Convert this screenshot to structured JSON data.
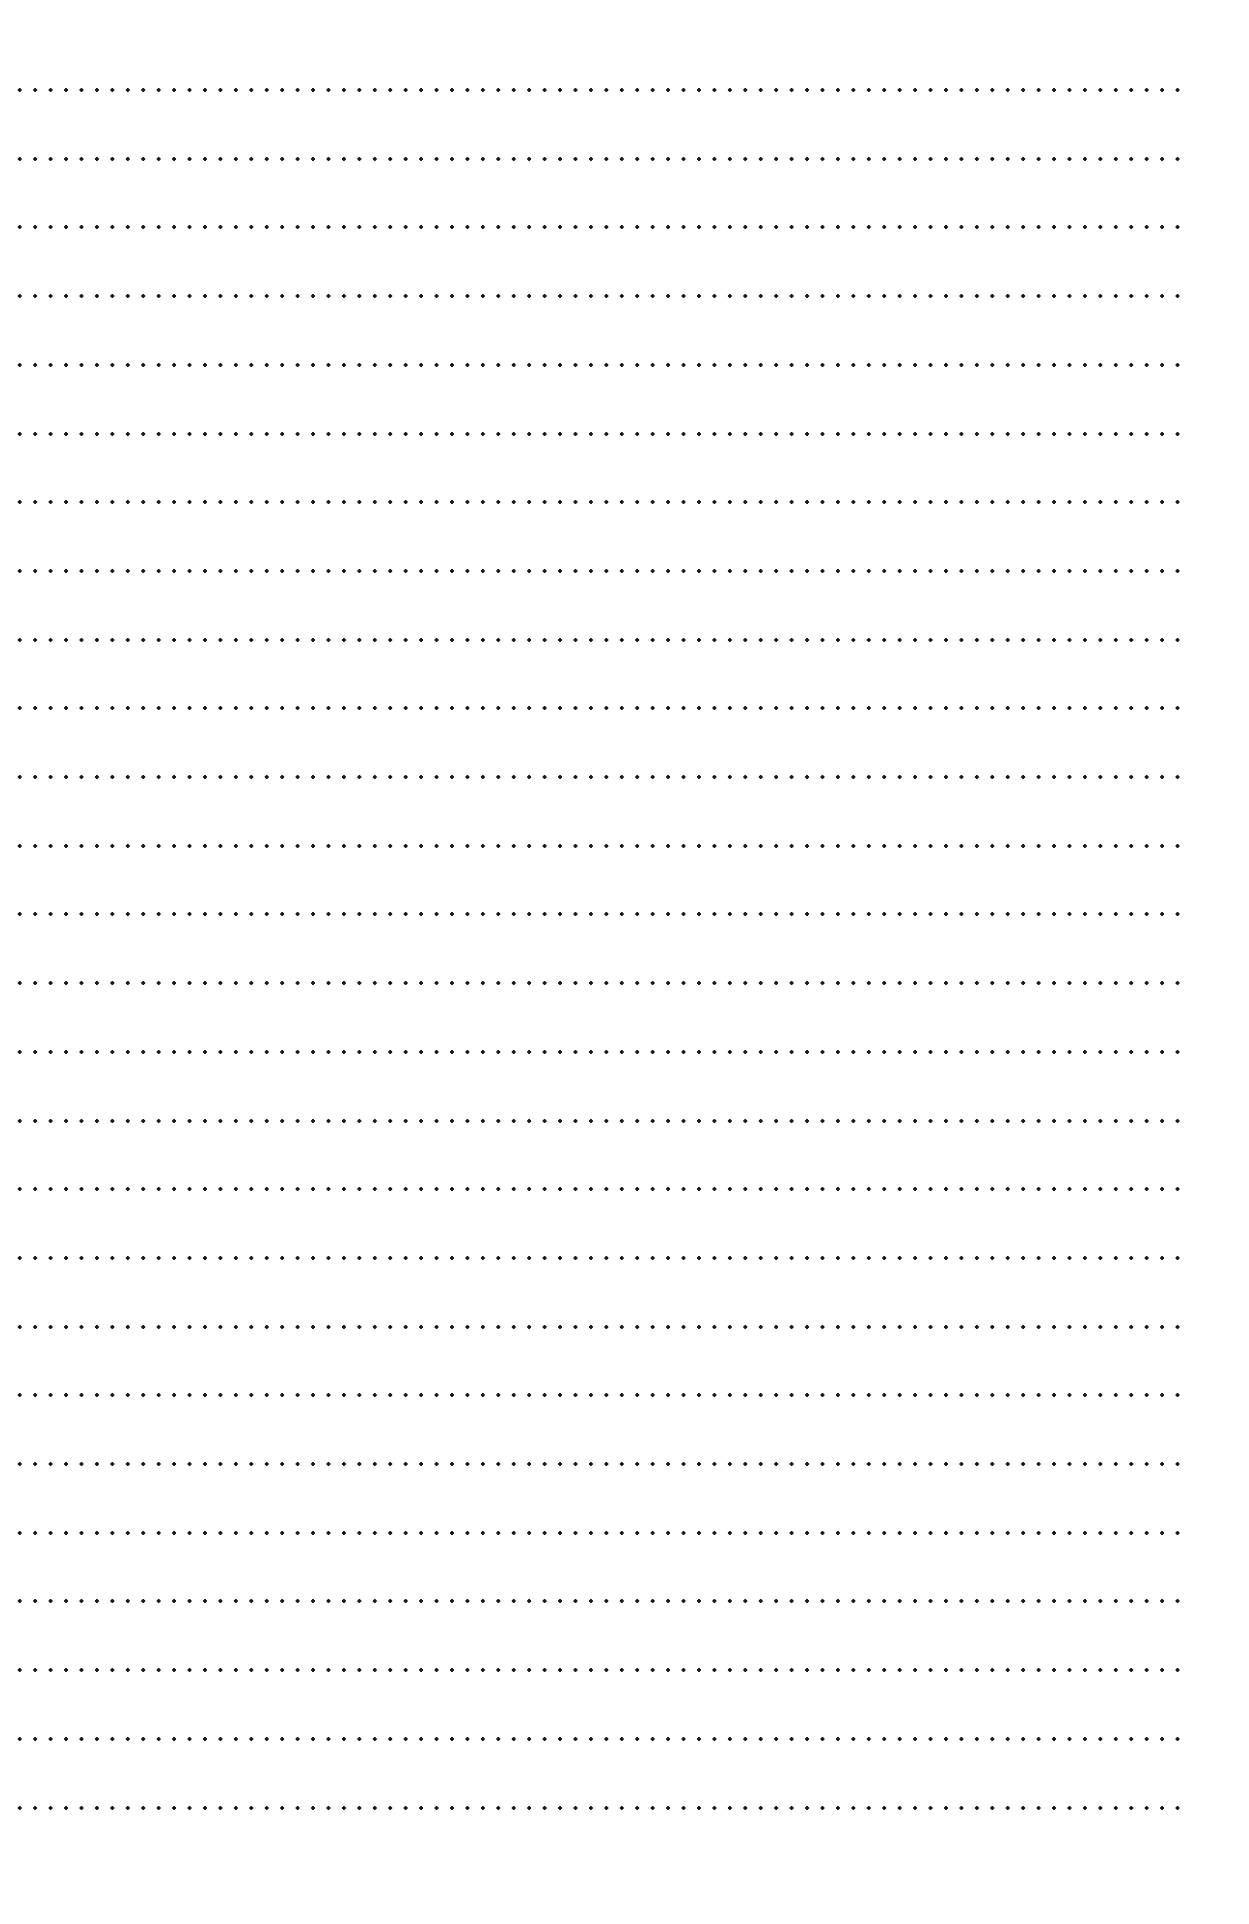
{
  "page": {
    "type": "blank ruled writing sheet",
    "background_color": "#ffffff",
    "dot_color": "#1a1a1a",
    "line_style": "dotted",
    "line_count": 26,
    "first_line_y": 88,
    "line_spacing": 68.7,
    "line_x_start": 12,
    "line_x_end": 1180,
    "dot_spacing": 15.45
  }
}
